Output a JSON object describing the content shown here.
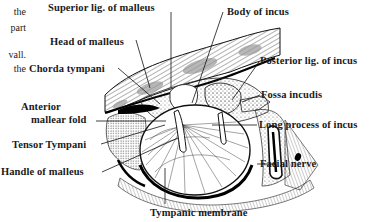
{
  "figure": {
    "left_text_fragments": [
      "the",
      "part",
      "vall.",
      "the"
    ],
    "labels": {
      "superior_lig_malleus": "Superior lig. of malleus",
      "body_of_incus": "Body of incus",
      "head_of_malleus": "Head of malleus",
      "posterior_lig_incus": "Posterior lig. of incus",
      "chorda_tympani": "Chorda tympani",
      "fossa_incudis": "Fossa incudis",
      "anterior_mallear_fold_1": "Anterior",
      "anterior_mallear_fold_2": "mallear fold",
      "long_process_incus": "Long process of incus",
      "tensor_tympani": "Tensor Tympani",
      "facial_nerve": "Facial nerve",
      "handle_of_malleus": "Handle of malleus",
      "tympanic_membrane": "Tympanic membrane"
    },
    "colors": {
      "ink": "#1a1a1a",
      "background": "#ffffff",
      "stipple": "#555555"
    }
  }
}
